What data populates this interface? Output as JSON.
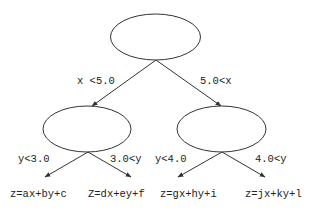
{
  "diagram": {
    "type": "decision-tree",
    "colors": {
      "stroke": "#333333",
      "text": "#222222",
      "background": "#ffffff"
    },
    "root": {
      "label": ""
    },
    "root_edges": {
      "left": "x <5.0",
      "right": "5.0<x"
    },
    "left_node": {
      "label": ""
    },
    "right_node": {
      "label": ""
    },
    "left_edges": {
      "left": "y<3.0",
      "right": "3.0<y"
    },
    "right_edges": {
      "left": "y<4.0",
      "right": "4.0<y"
    },
    "leaves": [
      "z=ax+by+c",
      "Z=dx+ey+f",
      "z=gx+hy+i",
      "z=jx+ky+l"
    ]
  }
}
